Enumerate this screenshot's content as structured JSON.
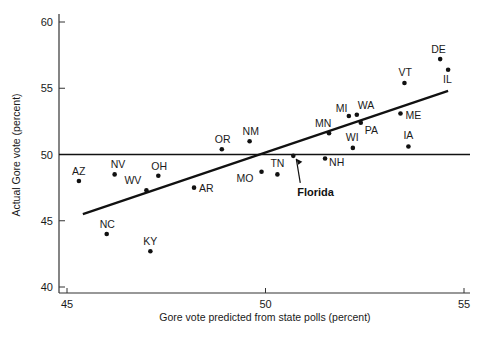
{
  "chart_data": {
    "type": "scatter",
    "title": "",
    "xlabel": "Gore vote predicted from state polls (percent)",
    "ylabel": "Actual Gore vote (percent)",
    "xlim": [
      44.8,
      55.1
    ],
    "ylim": [
      39.7,
      61.2
    ],
    "xticks": [
      45,
      50,
      55
    ],
    "yticks": [
      40,
      45,
      50,
      55,
      60
    ],
    "grid": false,
    "legend": null,
    "reference_line": {
      "type": "horizontal",
      "y": 50
    },
    "regression_line": {
      "x": [
        45.4,
        54.6
      ],
      "y": [
        45.5,
        54.8
      ]
    },
    "points": [
      {
        "label": "AZ",
        "x": 45.3,
        "y": 48.0,
        "lx": -7,
        "ly": -6
      },
      {
        "label": "NV",
        "x": 46.2,
        "y": 48.5,
        "lx": -4,
        "ly": -6
      },
      {
        "label": "NC",
        "x": 46.0,
        "y": 44.0,
        "lx": -7,
        "ly": -6
      },
      {
        "label": "WV",
        "x": 47.0,
        "y": 47.3,
        "lx": -22,
        "ly": -6
      },
      {
        "label": "OH",
        "x": 47.3,
        "y": 48.4,
        "lx": -7,
        "ly": -6
      },
      {
        "label": "KY",
        "x": 47.1,
        "y": 42.7,
        "lx": -7,
        "ly": -6
      },
      {
        "label": "AR",
        "x": 48.2,
        "y": 47.5,
        "lx": 5,
        "ly": 4
      },
      {
        "label": "OR",
        "x": 48.9,
        "y": 50.4,
        "lx": -7,
        "ly": -6
      },
      {
        "label": "NM",
        "x": 49.6,
        "y": 51.0,
        "lx": -7,
        "ly": -6
      },
      {
        "label": "MO",
        "x": 49.9,
        "y": 48.7,
        "lx": -25,
        "ly": 10
      },
      {
        "label": "TN",
        "x": 50.3,
        "y": 48.5,
        "lx": -7,
        "ly": -7
      },
      {
        "label": "Florida",
        "x": 50.7,
        "y": 49.9,
        "lx": 0,
        "ly": 0
      },
      {
        "label": "MN",
        "x": 51.6,
        "y": 51.6,
        "lx": -14,
        "ly": -6
      },
      {
        "label": "NH",
        "x": 51.5,
        "y": 49.7,
        "lx": 4,
        "ly": 8
      },
      {
        "label": "MI",
        "x": 52.1,
        "y": 52.9,
        "lx": -13,
        "ly": -4
      },
      {
        "label": "WA",
        "x": 52.3,
        "y": 53.0,
        "lx": 1,
        "ly": -6
      },
      {
        "label": "PA",
        "x": 52.4,
        "y": 52.4,
        "lx": 4,
        "ly": 11
      },
      {
        "label": "WI",
        "x": 52.2,
        "y": 50.5,
        "lx": -7,
        "ly": -7
      },
      {
        "label": "ME",
        "x": 53.4,
        "y": 53.1,
        "lx": 5,
        "ly": 6
      },
      {
        "label": "IA",
        "x": 53.6,
        "y": 50.6,
        "lx": -5,
        "ly": -8
      },
      {
        "label": "VT",
        "x": 53.5,
        "y": 55.4,
        "lx": -6,
        "ly": -7
      },
      {
        "label": "DE",
        "x": 54.4,
        "y": 57.2,
        "lx": -9,
        "ly": -6
      },
      {
        "label": "IL",
        "x": 54.6,
        "y": 56.4,
        "lx": -5,
        "ly": 13
      }
    ],
    "annotations": [
      {
        "text": "Florida",
        "target": "Florida",
        "text_x": 50.8,
        "text_y": 47.1,
        "bold": true
      }
    ]
  }
}
